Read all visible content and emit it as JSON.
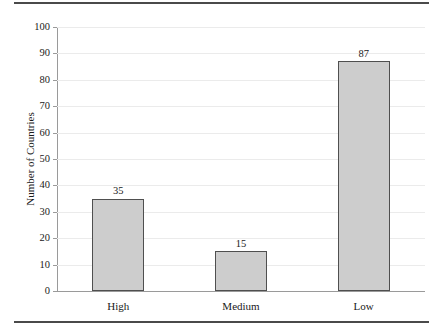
{
  "chart_data": {
    "type": "bar",
    "title": "",
    "subtitle": "",
    "xlabel": "",
    "ylabel": "Number of Countries",
    "categories": [
      "High",
      "Medium",
      "Low"
    ],
    "values": [
      35,
      15,
      87
    ],
    "value_labels": [
      "35",
      "15",
      "87"
    ],
    "ylim": [
      0,
      100
    ],
    "y_ticks": [
      0,
      10,
      20,
      30,
      40,
      50,
      60,
      70,
      80,
      90,
      100
    ],
    "y_tick_labels": [
      "0",
      "10",
      "20",
      "30",
      "40",
      "50",
      "60",
      "70",
      "80",
      "90",
      "100"
    ],
    "grid": true,
    "grid_axis": "y",
    "legend": false,
    "legend_position": "none",
    "series": [
      {
        "name": "Number of Countries",
        "values": [
          35,
          15,
          87
        ]
      }
    ],
    "colors": {
      "bar_fill": "#cdcdcd",
      "bar_border": "#4f4f4f",
      "gridline": "#ebebeb",
      "axis": "#9a9a9a",
      "rule": "#4a4a4a",
      "text": "#1a1a1a",
      "background": "#ffffff"
    }
  }
}
